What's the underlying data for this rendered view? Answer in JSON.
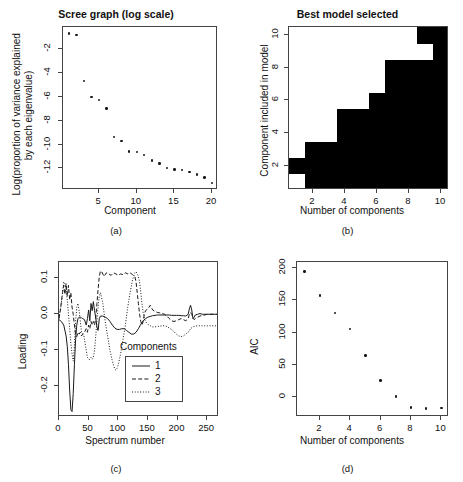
{
  "figure": {
    "panels": [
      {
        "caption": "(a)"
      },
      {
        "caption": "(b)"
      },
      {
        "caption": "(c)"
      },
      {
        "caption": "(d)"
      }
    ]
  },
  "chart_data": [
    {
      "type": "scatter",
      "panel": "a",
      "title": "Scree graph (log scale)",
      "xlabel": "Component",
      "ylabel": "Log(proportion of variance explained\nby each eigenvalue)",
      "ylabel_line1": "Log(proportion of variance explained",
      "ylabel_line2": "by each eigenvalue)",
      "xlim": [
        0.2,
        20.8
      ],
      "ylim": [
        -13.8,
        -0.2
      ],
      "xticks": [
        5,
        10,
        15,
        20
      ],
      "yticks": [
        -2,
        -4,
        -6,
        -8,
        -10,
        -12
      ],
      "grid": false,
      "x": [
        1,
        2,
        3,
        4,
        5,
        6,
        7,
        8,
        9,
        10,
        11,
        12,
        13,
        14,
        15,
        16,
        17,
        18,
        19,
        20
      ],
      "values": [
        -0.75,
        -0.85,
        -4.7,
        -6.05,
        -6.3,
        -7.0,
        -9.4,
        -9.7,
        -10.6,
        -10.65,
        -10.9,
        -11.35,
        -11.6,
        -11.95,
        -12.1,
        -12.15,
        -12.3,
        -12.5,
        -12.75,
        -13.2
      ]
    },
    {
      "type": "heatmap",
      "panel": "b",
      "title": "Best model selected",
      "xlabel": "Number of components",
      "ylabel": "Component included in model",
      "xticks": [
        2,
        4,
        6,
        8,
        10
      ],
      "yticks": [
        2,
        4,
        6,
        8,
        10
      ],
      "x_categories": [
        1,
        2,
        3,
        4,
        5,
        6,
        7,
        8,
        9,
        10
      ],
      "y_categories": [
        1,
        2,
        3,
        4,
        5,
        6,
        7,
        8,
        9,
        10
      ],
      "color_true": "#000000",
      "color_false": "#ffffff",
      "note": "matrix[row] = component index 1..10 bottom-to-top; 1 = black (included)",
      "matrix": [
        [
          0,
          1,
          1,
          1,
          1,
          1,
          1,
          1,
          1,
          1
        ],
        [
          1,
          1,
          1,
          1,
          1,
          1,
          1,
          1,
          1,
          1
        ],
        [
          0,
          1,
          1,
          1,
          1,
          1,
          1,
          1,
          1,
          1
        ],
        [
          0,
          0,
          0,
          1,
          1,
          1,
          1,
          1,
          1,
          1
        ],
        [
          0,
          0,
          0,
          1,
          1,
          1,
          1,
          1,
          1,
          1
        ],
        [
          0,
          0,
          0,
          0,
          0,
          1,
          1,
          1,
          1,
          1
        ],
        [
          0,
          0,
          0,
          0,
          0,
          0,
          1,
          1,
          1,
          1
        ],
        [
          0,
          0,
          0,
          0,
          0,
          0,
          1,
          1,
          1,
          1
        ],
        [
          0,
          0,
          0,
          0,
          0,
          0,
          0,
          0,
          0,
          1
        ],
        [
          0,
          0,
          0,
          0,
          0,
          0,
          0,
          0,
          1,
          1
        ]
      ]
    },
    {
      "type": "line",
      "panel": "c",
      "title": "",
      "xlabel": "Spectrum number",
      "ylabel": "Loading",
      "xlim": [
        0,
        270
      ],
      "ylim": [
        -0.285,
        0.145
      ],
      "xticks": [
        0,
        50,
        100,
        150,
        200,
        250
      ],
      "yticks": [
        0.1,
        0.0,
        -0.1,
        -0.2
      ],
      "ytick_labels": [
        "0.1",
        "0.0",
        "-0.1",
        "-0.2"
      ],
      "grid": false,
      "legend": {
        "title": "Components",
        "position": "bottom-right",
        "entries": [
          {
            "label": "1",
            "style": "solid"
          },
          {
            "label": "2",
            "style": "dashed"
          },
          {
            "label": "3",
            "style": "dotted"
          }
        ]
      },
      "series": [
        {
          "name": "1",
          "style": "solid",
          "x": [
            0,
            4,
            8,
            12,
            14,
            16,
            18,
            20,
            22,
            24,
            26,
            28,
            30,
            32,
            34,
            36,
            38,
            40,
            43,
            46,
            48,
            50,
            52,
            54,
            56,
            58,
            60,
            62,
            64,
            66,
            68,
            70,
            74,
            78,
            82,
            86,
            90,
            94,
            98,
            102,
            106,
            110,
            114,
            118,
            122,
            126,
            130,
            134,
            138,
            142,
            146,
            150,
            154,
            158,
            162,
            166,
            170,
            174,
            178,
            182,
            186,
            190,
            194,
            198,
            202,
            206,
            210,
            214,
            218,
            220,
            222,
            224,
            226,
            228,
            230,
            234,
            238,
            242,
            246,
            250,
            254,
            258,
            262,
            266,
            270
          ],
          "values": [
            -0.015,
            -0.02,
            -0.03,
            -0.06,
            -0.09,
            -0.14,
            -0.21,
            -0.265,
            -0.27,
            -0.22,
            -0.14,
            -0.07,
            -0.03,
            -0.012,
            -0.008,
            -0.008,
            -0.01,
            -0.012,
            -0.015,
            -0.03,
            -0.012,
            0.012,
            -0.018,
            0.03,
            0.01,
            0.035,
            0.01,
            -0.01,
            -0.035,
            -0.045,
            -0.012,
            -0.005,
            -0.005,
            -0.008,
            -0.012,
            -0.02,
            -0.03,
            -0.038,
            -0.042,
            -0.042,
            -0.04,
            -0.04,
            -0.045,
            -0.05,
            -0.055,
            -0.055,
            -0.05,
            -0.04,
            -0.028,
            -0.018,
            -0.012,
            -0.008,
            -0.006,
            -0.004,
            -0.003,
            -0.002,
            -0.002,
            -0.002,
            -0.002,
            -0.002,
            -0.002,
            -0.003,
            -0.003,
            -0.003,
            -0.003,
            -0.004,
            -0.004,
            -0.005,
            0.0,
            0.015,
            0.025,
            0.012,
            -0.012,
            -0.008,
            -0.002,
            0.0,
            0.002,
            0.0,
            0.0,
            0.0,
            0.0,
            0.0,
            0.0,
            0.0,
            0.0
          ]
        },
        {
          "name": "2",
          "style": "dashed",
          "x": [
            0,
            3,
            6,
            8,
            10,
            12,
            14,
            16,
            18,
            20,
            22,
            24,
            26,
            28,
            30,
            32,
            34,
            36,
            38,
            40,
            43,
            46,
            48,
            50,
            52,
            54,
            56,
            58,
            60,
            62,
            64,
            66,
            68,
            70,
            72,
            76,
            80,
            84,
            88,
            92,
            96,
            100,
            104,
            108,
            112,
            116,
            120,
            124,
            128,
            130,
            132,
            134,
            136,
            138,
            140,
            142,
            144,
            146,
            150,
            154,
            158,
            162,
            166,
            170,
            174,
            178,
            182,
            186,
            190,
            194,
            198,
            202,
            206,
            210,
            214,
            218,
            220,
            222,
            224,
            226,
            228,
            230,
            234,
            238,
            242,
            246,
            250,
            254,
            258,
            262,
            266,
            270
          ],
          "values": [
            -0.012,
            0.02,
            0.06,
            0.08,
            0.055,
            0.085,
            0.05,
            0.08,
            0.04,
            0.06,
            0.02,
            0.0,
            -0.03,
            -0.055,
            -0.062,
            -0.05,
            -0.055,
            -0.05,
            -0.06,
            -0.055,
            -0.05,
            -0.04,
            -0.05,
            -0.03,
            -0.04,
            -0.02,
            -0.03,
            -0.02,
            -0.03,
            -0.01,
            0.03,
            0.07,
            0.105,
            0.12,
            0.118,
            0.105,
            0.115,
            0.112,
            0.108,
            0.115,
            0.112,
            0.108,
            0.112,
            0.11,
            0.115,
            0.112,
            0.115,
            0.11,
            0.105,
            0.09,
            0.06,
            0.03,
            0.0,
            -0.02,
            -0.03,
            -0.02,
            0.0,
            0.01,
            0.015,
            0.025,
            0.012,
            0.008,
            0.005,
            0.004,
            0.002,
            0.0,
            -0.005,
            -0.012,
            -0.018,
            -0.02,
            -0.018,
            -0.015,
            -0.012,
            -0.015,
            -0.018,
            -0.012,
            0.0,
            0.005,
            0.0,
            -0.01,
            -0.015,
            -0.012,
            -0.008,
            -0.005,
            -0.003,
            -0.002,
            0.0,
            0.0,
            0.0,
            0.0,
            0.0,
            0.0
          ]
        },
        {
          "name": "3",
          "style": "dotted",
          "x": [
            0,
            3,
            6,
            8,
            10,
            12,
            14,
            16,
            18,
            20,
            22,
            24,
            26,
            28,
            30,
            32,
            34,
            36,
            38,
            40,
            42,
            44,
            46,
            48,
            50,
            52,
            54,
            56,
            58,
            60,
            62,
            64,
            66,
            68,
            70,
            74,
            78,
            82,
            86,
            90,
            94,
            96,
            98,
            100,
            104,
            108,
            112,
            116,
            120,
            124,
            128,
            130,
            132,
            134,
            136,
            138,
            140,
            142,
            144,
            146,
            150,
            154,
            158,
            162,
            166,
            170,
            174,
            178,
            182,
            186,
            190,
            194,
            198,
            202,
            206,
            210,
            214,
            218,
            222,
            226,
            230,
            234,
            238,
            242,
            246,
            250,
            254,
            258,
            262,
            266,
            270
          ],
          "values": [
            -0.01,
            0.02,
            0.06,
            0.09,
            0.085,
            0.07,
            0.04,
            0.0,
            -0.04,
            -0.08,
            -0.11,
            -0.13,
            -0.09,
            -0.02,
            0.02,
            0.03,
            0.01,
            -0.02,
            -0.05,
            -0.055,
            -0.06,
            -0.08,
            -0.1,
            -0.12,
            -0.125,
            -0.125,
            -0.12,
            -0.125,
            -0.12,
            -0.1,
            -0.06,
            -0.02,
            0.02,
            0.05,
            0.06,
            0.03,
            -0.02,
            -0.06,
            -0.1,
            -0.13,
            -0.152,
            -0.155,
            -0.15,
            -0.14,
            -0.11,
            -0.07,
            -0.03,
            0.02,
            0.06,
            0.095,
            0.115,
            0.118,
            0.112,
            0.105,
            0.09,
            0.06,
            0.03,
            0.005,
            -0.01,
            -0.02,
            -0.028,
            -0.032,
            -0.035,
            -0.035,
            -0.034,
            -0.033,
            -0.032,
            -0.032,
            -0.034,
            -0.038,
            -0.042,
            -0.048,
            -0.055,
            -0.06,
            -0.062,
            -0.06,
            -0.055,
            -0.05,
            -0.04,
            -0.035,
            -0.033,
            -0.032,
            -0.032,
            -0.032,
            -0.032,
            -0.032,
            -0.032,
            -0.032,
            -0.032,
            -0.032,
            -0.032
          ]
        }
      ]
    },
    {
      "type": "scatter",
      "panel": "d",
      "title": "",
      "xlabel": "Number of components",
      "ylabel": "AIC",
      "xlim": [
        0.5,
        10.5
      ],
      "ylim": [
        -32,
        210
      ],
      "xticks": [
        2,
        4,
        6,
        8,
        10
      ],
      "yticks": [
        0,
        50,
        100,
        150,
        200
      ],
      "grid": false,
      "x": [
        1,
        2,
        3,
        4,
        5,
        6,
        7,
        8,
        9,
        10
      ],
      "values": [
        195,
        158,
        130,
        105,
        64,
        25,
        0,
        -17,
        -19,
        -18
      ]
    }
  ]
}
